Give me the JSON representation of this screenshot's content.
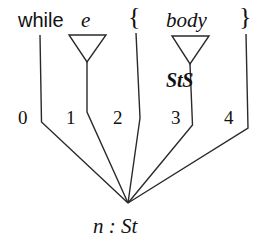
{
  "diagram": {
    "kind": "parse-tree",
    "stroke_color": "#2a2a2a",
    "background_color": "#ffffff",
    "root": {
      "label": "n : St",
      "x": 128,
      "y": 203
    },
    "children": [
      {
        "index": "0",
        "label": "while",
        "label_style": "upright",
        "node_type": "terminal",
        "label_x": 18,
        "label_y": 10,
        "num_x": 18,
        "num_y": 108,
        "edge": "M 40 35 L 41.5 122 L 128 203"
      },
      {
        "index": "1",
        "label": "e",
        "label_style": "italic",
        "node_type": "nonterminal",
        "label_x": 81,
        "label_y": 10,
        "num_x": 66,
        "num_y": 108,
        "triangle": {
          "left": 69,
          "right": 106,
          "top": 35,
          "apex_x": 87,
          "apex_y": 62
        },
        "edge": "M 87 62 L 87 112 L 128 203"
      },
      {
        "index": "2",
        "label": "{",
        "label_style": "brace",
        "node_type": "terminal",
        "label_x": 128,
        "label_y": 6,
        "num_x": 113,
        "num_y": 108,
        "edge": "M 136 33 L 140 118 L 128 203"
      },
      {
        "index": "3",
        "label": "body",
        "label_style": "italic",
        "node_type": "nonterminal",
        "label_x": 166,
        "label_y": 10,
        "num_x": 171,
        "num_y": 108,
        "type_annotation": "StS",
        "annot_x": 166,
        "annot_y": 70,
        "triangle": {
          "left": 172,
          "right": 209,
          "top": 36,
          "apex_x": 190,
          "apex_y": 64
        },
        "edge": "M 190 64 L 192.5 125 L 128 203"
      },
      {
        "index": "4",
        "label": "}",
        "label_style": "brace",
        "node_type": "terminal",
        "label_x": 239,
        "label_y": 6,
        "num_x": 224,
        "num_y": 108,
        "edge": "M 246 34 L 248 128 L 128 203"
      }
    ]
  }
}
